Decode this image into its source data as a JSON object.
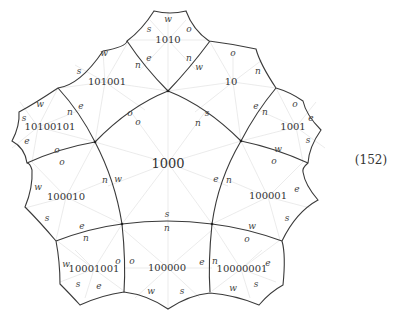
{
  "equation_number": "(152)",
  "center_tile": {
    "label": "1000",
    "ports": {
      "n_top_left": "n",
      "w_top_left": "o",
      "s_top_right": "s",
      "n_top_right": "n",
      "w_left": "w",
      "n_left": "n",
      "s_bottom": "s",
      "e_right": "e",
      "n_right": "n"
    }
  },
  "tiles": [
    {
      "id": "t1010",
      "label": "1010",
      "ports": [
        "w",
        "s",
        "o",
        "e",
        "n"
      ]
    },
    {
      "id": "t101001",
      "label": "101001",
      "ports": [
        "w",
        "s",
        "n",
        "e",
        "o"
      ]
    },
    {
      "id": "t10",
      "label": "10",
      "ports": [
        "o",
        "n",
        "w",
        "e",
        "s"
      ]
    },
    {
      "id": "t10100101",
      "label": "10100101",
      "ports": [
        "w",
        "s",
        "n",
        "e",
        "o"
      ]
    },
    {
      "id": "t1001",
      "label": "1001",
      "ports": [
        "o",
        "e",
        "n",
        "s",
        "w"
      ]
    },
    {
      "id": "t100010",
      "label": "100010",
      "ports": [
        "o",
        "w",
        "n",
        "s",
        "e"
      ]
    },
    {
      "id": "t100001",
      "label": "100001",
      "ports": [
        "o",
        "e",
        "n",
        "s",
        "w"
      ]
    },
    {
      "id": "t10001001",
      "label": "10001001",
      "ports": [
        "n",
        "w",
        "o",
        "s",
        "e"
      ]
    },
    {
      "id": "t100000",
      "label": "100000",
      "ports": [
        "n",
        "o",
        "e",
        "w",
        "s"
      ]
    },
    {
      "id": "t10000001",
      "label": "10000001",
      "ports": [
        "o",
        "n",
        "e",
        "w",
        "s"
      ]
    }
  ],
  "ports": {
    "t1010_w": "w",
    "t1010_s": "s",
    "t1010_o": "o",
    "t1010_e": "e",
    "t1010_n": "n",
    "t101001_w": "w",
    "t101001_s": "s",
    "t101001_n": "n",
    "t101001_e": "e",
    "t101001_o": "o",
    "t10_o": "o",
    "t10_n": "n",
    "t10_w": "w",
    "t10_e": "e",
    "t10_s": "s",
    "t10100101_w": "w",
    "t10100101_s": "s",
    "t10100101_n": "n",
    "t10100101_e": "e",
    "t10100101_o": "o",
    "t1001_o": "o",
    "t1001_e": "e",
    "t1001_n": "n",
    "t1001_s": "s",
    "t1001_w": "w",
    "t100010_o": "o",
    "t100010_w": "w",
    "t100010_n": "n",
    "t100010_s": "s",
    "t100010_e": "e",
    "t100001_o": "o",
    "t100001_e": "e",
    "t100001_n": "n",
    "t100001_s": "s",
    "t100001_w": "w",
    "t10001001_n": "n",
    "t10001001_w": "w",
    "t10001001_o": "o",
    "t10001001_s": "s",
    "t10001001_e": "e",
    "t100000_n": "n",
    "t100000_o": "o",
    "t100000_e": "e",
    "t100000_w": "w",
    "t100000_s": "s",
    "t10000001_o": "o",
    "t10000001_n": "n",
    "t10000001_e": "e",
    "t10000001_w": "w",
    "t10000001_s": "s",
    "c_o_tl": "o",
    "c_n_tr": "n",
    "c_w_l": "w",
    "c_e_r": "e",
    "c_s_b": "s",
    "t101001_o2": "o",
    "t10_s2": "s"
  }
}
